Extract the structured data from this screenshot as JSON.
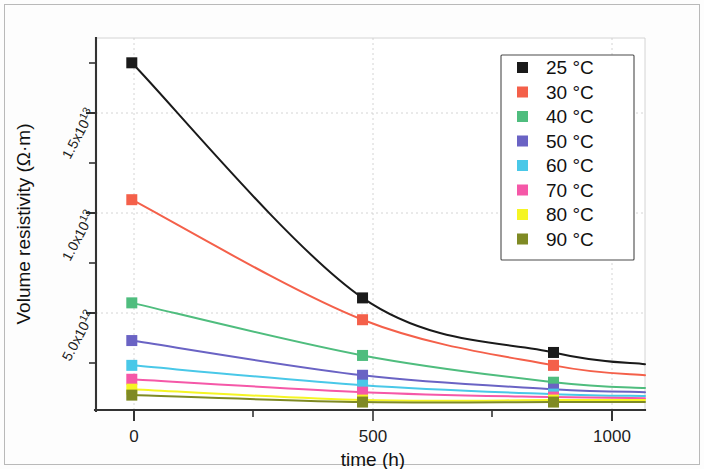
{
  "chart_data": {
    "type": "line",
    "title": "",
    "xlabel": "time (h)",
    "ylabel": "Volume resistivity (Ω·m)",
    "xlim": [
      -90,
      1290
    ],
    "ylim": [
      0,
      18750000000000
    ],
    "xticks": [
      0,
      500,
      1000
    ],
    "xtick_labels": [
      "0",
      "500",
      "1000"
    ],
    "yticks": [
      5000000000000,
      10000000000000,
      15000000000000
    ],
    "ytick_labels": [
      "5.0x10",
      "1.0x10",
      "1.5x10"
    ],
    "ytick_exponents": [
      "12",
      "13",
      "13"
    ],
    "grid": "dashed-both-axes",
    "legend_position": "upper-right",
    "x": [
      0,
      580,
      1060
    ],
    "series": [
      {
        "name": "25 °C",
        "label": "25 °C",
        "color": "#1a1a1a",
        "values": [
          17500000000000,
          5650000000000,
          2900000000000
        ]
      },
      {
        "name": "30 °C",
        "label": "30 °C",
        "color": "#f4604a",
        "values": [
          10600000000000,
          4550000000000,
          2250000000000
        ]
      },
      {
        "name": "40 °C",
        "label": "40 °C",
        "color": "#4fbd7e",
        "values": [
          5400000000000,
          2750000000000,
          1400000000000
        ]
      },
      {
        "name": "50 °C",
        "label": "50 °C",
        "color": "#6a63c4",
        "values": [
          3500000000000,
          1750000000000,
          1050000000000
        ]
      },
      {
        "name": "60 °C",
        "label": "60 °C",
        "color": "#49c8e8",
        "values": [
          2250000000000,
          1250000000000,
          800000000000
        ]
      },
      {
        "name": "70 °C",
        "label": "70 °C",
        "color": "#f558a8",
        "values": [
          1550000000000,
          900000000000,
          650000000000
        ]
      },
      {
        "name": "80 °C",
        "label": "80 °C",
        "color": "#f5f524",
        "values": [
          1050000000000,
          500000000000,
          500000000000
        ]
      },
      {
        "name": "90 °C",
        "label": "90 °C",
        "color": "#7f8a24",
        "values": [
          750000000000,
          400000000000,
          400000000000
        ]
      }
    ]
  },
  "axes": {
    "x_title": "time (h)",
    "y_title_prefix": "Volume resistivity (Ω·m)",
    "x_tick_labels": [
      "0",
      "500",
      "1000"
    ],
    "y_tick_mantissas": [
      "5.0x10",
      "1.0x10",
      "1.5x10"
    ],
    "y_tick_exponents": [
      "12",
      "13",
      "13"
    ]
  },
  "legend": {
    "items": [
      {
        "label": "25 °C",
        "color": "#1a1a1a"
      },
      {
        "label": "30 °C",
        "color": "#f4604a"
      },
      {
        "label": "40 °C",
        "color": "#4fbd7e"
      },
      {
        "label": "50 °C",
        "color": "#6a63c4"
      },
      {
        "label": "60 °C",
        "color": "#49c8e8"
      },
      {
        "label": "70 °C",
        "color": "#f558a8"
      },
      {
        "label": "80 °C",
        "color": "#f5f524"
      },
      {
        "label": "90 °C",
        "color": "#7f8a24"
      }
    ]
  }
}
